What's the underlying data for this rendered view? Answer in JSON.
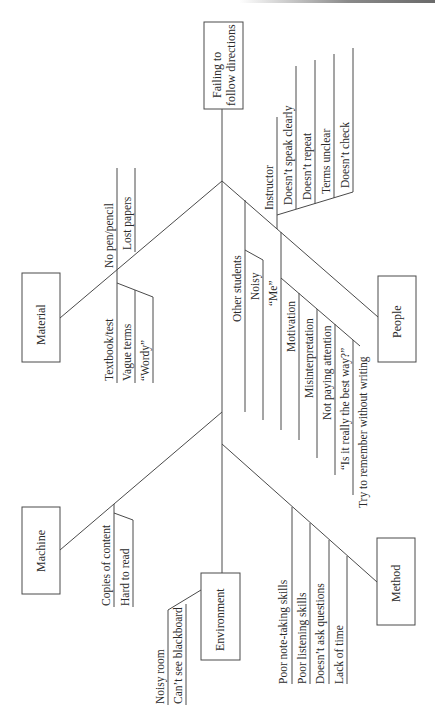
{
  "diagram": {
    "type": "fishbone",
    "effect": {
      "line1": "Failing to",
      "line2": "follow directions"
    },
    "categories": {
      "material": {
        "label": "Material",
        "causes": [
          "No pen/pencil",
          "Lost papers",
          "Textbook/test",
          "Vague terms",
          "“Wordy”"
        ]
      },
      "people": {
        "label": "People",
        "instructor": {
          "label": "Instructor",
          "causes": [
            "Doesn’t speak clearly",
            "Doesn’t repeat",
            "Terms unclear",
            "Doesn’t check"
          ]
        },
        "other_students": {
          "label": "Other students",
          "causes": [
            "Noisy",
            "“Me”"
          ]
        },
        "motivation": {
          "label": "Motivation",
          "causes": [
            "Misinterpretation",
            "Not paying attention",
            "“Is it really the best way?”",
            "Try to remember without writing"
          ]
        }
      },
      "machine": {
        "label": "Machine",
        "causes": [
          "Copies of content",
          "Hard to read"
        ]
      },
      "environment": {
        "label": "Environment",
        "causes": [
          "Noisy room",
          "Can’t see blackboard"
        ]
      },
      "method": {
        "label": "Method",
        "causes": [
          "Poor note-taking skills",
          "Poor listening skills",
          "Doesn’t ask questions",
          "Lack of time"
        ]
      }
    }
  }
}
